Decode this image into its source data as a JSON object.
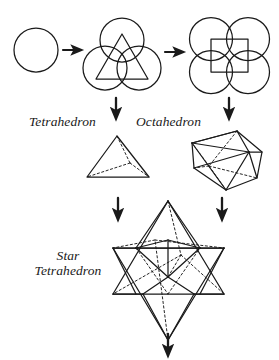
{
  "figure": {
    "title_absent": true,
    "background_color": "#ffffff",
    "stroke_color": "#1a1a1a",
    "labels": {
      "tetrahedron": "Tetrahedron",
      "octahedron": "Octahedron",
      "star_line1": "Star",
      "star_line2": "Tetrahedron"
    },
    "stages": [
      {
        "id": "stage-1-circle",
        "name": "single-circle",
        "shape": "circle",
        "circle_count": 1,
        "inscribed": "none",
        "center": [
          36,
          50
        ],
        "radius": 22
      },
      {
        "id": "stage-2-vesica-triad",
        "name": "three-circles-with-triangle",
        "shape": "circles",
        "circle_count": 3,
        "inscribed": "triangle",
        "centers": [
          [
            122,
            38
          ],
          [
            105,
            65
          ],
          [
            139,
            65
          ]
        ],
        "radius": 22
      },
      {
        "id": "stage-3-quad-circles",
        "name": "four-circles-with-square",
        "shape": "circles",
        "circle_count": 4,
        "inscribed": "square",
        "centers": [
          [
            212,
            38
          ],
          [
            246,
            38
          ],
          [
            212,
            70
          ],
          [
            246,
            70
          ]
        ],
        "radius": 22
      },
      {
        "id": "stage-4-tetrahedron",
        "name": "tetrahedron-solid",
        "shape": "polyhedron",
        "faces": 4,
        "vertices": 4,
        "edges": 6,
        "label": "Tetrahedron"
      },
      {
        "id": "stage-5-octahedron",
        "name": "octahedron-solid",
        "shape": "polyhedron",
        "faces": 8,
        "vertices": 6,
        "edges": 12,
        "label": "Octahedron"
      },
      {
        "id": "stage-6-star-tetrahedron",
        "name": "star-tetrahedron-solid",
        "shape": "compound-polyhedron",
        "components": 2,
        "label": "Star Tetrahedron"
      }
    ],
    "arrows": [
      {
        "id": "arrow-1",
        "direction": "right",
        "from": "stage-1-circle",
        "to": "stage-2-vesica-triad"
      },
      {
        "id": "arrow-2",
        "direction": "right",
        "from": "stage-2-vesica-triad",
        "to": "stage-3-quad-circles"
      },
      {
        "id": "arrow-3",
        "direction": "down",
        "from": "stage-2-vesica-triad",
        "to": "stage-4-tetrahedron"
      },
      {
        "id": "arrow-4",
        "direction": "down",
        "from": "stage-3-quad-circles",
        "to": "stage-5-octahedron"
      },
      {
        "id": "arrow-5",
        "direction": "down",
        "from": "stage-4-tetrahedron",
        "to": "stage-6-star-tetrahedron"
      },
      {
        "id": "arrow-6",
        "direction": "down",
        "from": "stage-5-octahedron",
        "to": "stage-6-star-tetrahedron"
      },
      {
        "id": "arrow-7",
        "direction": "down",
        "from": "stage-6-star-tetrahedron",
        "to": "continuation"
      }
    ]
  }
}
